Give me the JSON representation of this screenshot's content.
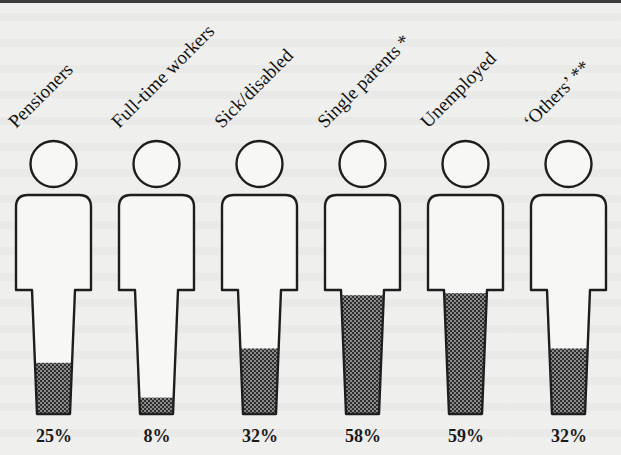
{
  "chart_data": {
    "type": "pictogram",
    "title": "",
    "xlabel": "",
    "ylabel": "",
    "ylim": [
      0,
      100
    ],
    "categories": [
      "Pensioners",
      "Full-time workers",
      "Sick/disabled",
      "Single parents *",
      "Unemployed",
      "‘Others’ **"
    ],
    "values": [
      25,
      8,
      32,
      58,
      59,
      32
    ],
    "value_labels": [
      "25%",
      "8%",
      "32%",
      "58%",
      "59%",
      "32%"
    ],
    "unit": "%",
    "legend": null,
    "grid": false
  },
  "figures": [
    {
      "label": "Pensioners",
      "value": 25,
      "value_label": "25%"
    },
    {
      "label": "Full-time workers",
      "value": 8,
      "value_label": "8%"
    },
    {
      "label": "Sick/disabled",
      "value": 32,
      "value_label": "32%"
    },
    {
      "label": "Single parents *",
      "value": 58,
      "value_label": "58%"
    },
    {
      "label": "Unemployed",
      "value": 59,
      "value_label": "59%"
    },
    {
      "label": "‘Others’ **",
      "value": 32,
      "value_label": "32%"
    }
  ],
  "colors": {
    "outline": "#1e1e1e",
    "fill_dark": "#2e2e2e",
    "fill_light": "#8a8a8a",
    "figure_bg": "#f7f7f5",
    "page_bg": "#efefed"
  }
}
